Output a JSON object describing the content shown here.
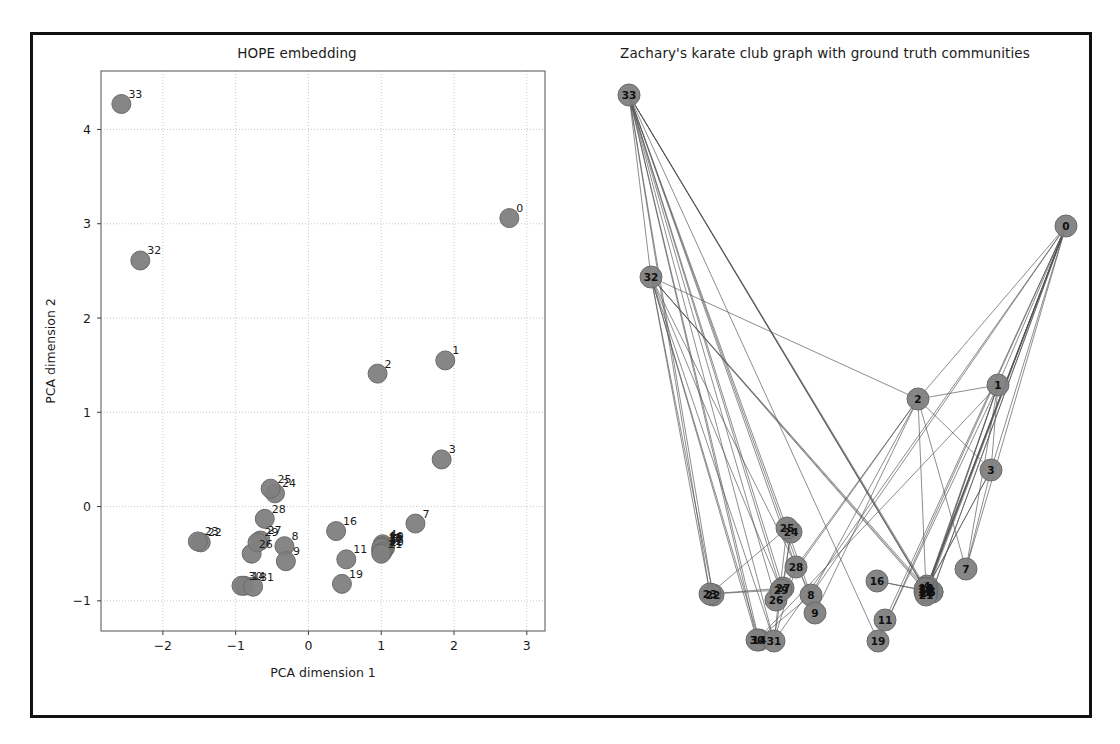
{
  "figure": {
    "background": "#ffffff",
    "frame_color": "#111111",
    "node_color": "#808080",
    "node_edge_color": "#6b6b6b",
    "edge_color": "#555555",
    "grid_color": "#c8c8c8"
  },
  "panels": [
    {
      "id": "hope-embedding",
      "title": "HOPE embedding",
      "xlabel": "PCA dimension 1",
      "ylabel": "PCA dimension 2",
      "xticks": [
        -2,
        -1,
        0,
        1,
        2,
        3
      ],
      "yticks": [
        -1,
        0,
        1,
        2,
        3,
        4
      ],
      "xlim": [
        -2.85,
        3.25
      ],
      "ylim": [
        -1.32,
        4.62
      ]
    },
    {
      "id": "karate-graph",
      "title": "Zachary's karate club graph with ground truth communities"
    }
  ],
  "chart_data": {
    "type": "scatter",
    "title": "HOPE embedding",
    "xlabel": "PCA dimension 1",
    "ylabel": "PCA dimension 2",
    "xlim": [
      -2.85,
      3.25
    ],
    "ylim": [
      -1.32,
      4.62
    ],
    "xticks": [
      -2,
      -1,
      0,
      1,
      2,
      3
    ],
    "yticks": [
      -1,
      0,
      1,
      2,
      3,
      4
    ],
    "grid": true,
    "legend": null,
    "point_labels_shown": true,
    "series": [
      {
        "name": "karate club nodes (HOPE + PCA)",
        "points": [
          {
            "label": "0",
            "x": 2.76,
            "y": 3.06
          },
          {
            "label": "1",
            "x": 1.88,
            "y": 1.55
          },
          {
            "label": "2",
            "x": 0.95,
            "y": 1.41
          },
          {
            "label": "3",
            "x": 1.83,
            "y": 0.5
          },
          {
            "label": "4",
            "x": 1.02,
            "y": -0.4
          },
          {
            "label": "5",
            "x": 1.05,
            "y": -0.44
          },
          {
            "label": "6",
            "x": 1.05,
            "y": -0.44
          },
          {
            "label": "7",
            "x": 1.47,
            "y": -0.18
          },
          {
            "label": "8",
            "x": -0.33,
            "y": -0.42
          },
          {
            "label": "9",
            "x": -0.31,
            "y": -0.58
          },
          {
            "label": "10",
            "x": 1.02,
            "y": -0.42
          },
          {
            "label": "11",
            "x": 0.52,
            "y": -0.56
          },
          {
            "label": "12",
            "x": 1.0,
            "y": -0.47
          },
          {
            "label": "13",
            "x": 1.02,
            "y": -0.45
          },
          {
            "label": "14",
            "x": -0.88,
            "y": -0.84
          },
          {
            "label": "15",
            "x": 1.01,
            "y": -0.43
          },
          {
            "label": "16",
            "x": 0.38,
            "y": -0.26
          },
          {
            "label": "17",
            "x": 1.01,
            "y": -0.46
          },
          {
            "label": "18",
            "x": 1.0,
            "y": -0.44
          },
          {
            "label": "19",
            "x": 0.46,
            "y": -0.82
          },
          {
            "label": "20",
            "x": 1.02,
            "y": -0.48
          },
          {
            "label": "21",
            "x": 1.0,
            "y": -0.5
          },
          {
            "label": "22",
            "x": -1.48,
            "y": -0.38
          },
          {
            "label": "23",
            "x": -1.52,
            "y": -0.37
          },
          {
            "label": "24",
            "x": -0.46,
            "y": 0.14
          },
          {
            "label": "25",
            "x": -0.52,
            "y": 0.19
          },
          {
            "label": "26",
            "x": -0.78,
            "y": -0.5
          },
          {
            "label": "27",
            "x": -0.66,
            "y": -0.36
          },
          {
            "label": "28",
            "x": -0.6,
            "y": -0.13
          },
          {
            "label": "29",
            "x": -0.7,
            "y": -0.38
          },
          {
            "label": "30",
            "x": -0.92,
            "y": -0.84
          },
          {
            "label": "31",
            "x": -0.76,
            "y": -0.85
          },
          {
            "label": "32",
            "x": -2.31,
            "y": 2.61
          },
          {
            "label": "33",
            "x": -2.57,
            "y": 4.27
          }
        ]
      }
    ]
  },
  "graph": {
    "title": "Zachary's karate club graph with ground truth communities",
    "node_labels_inside": true,
    "nodes": [
      {
        "id": "0",
        "x": 1065,
        "y": 223
      },
      {
        "id": "1",
        "x": 997,
        "y": 382
      },
      {
        "id": "2",
        "x": 917,
        "y": 396
      },
      {
        "id": "3",
        "x": 990,
        "y": 467
      },
      {
        "id": "4",
        "x": 926,
        "y": 583
      },
      {
        "id": "5",
        "x": 931,
        "y": 589
      },
      {
        "id": "6",
        "x": 931,
        "y": 589
      },
      {
        "id": "7",
        "x": 965,
        "y": 566
      },
      {
        "id": "8",
        "x": 810,
        "y": 592
      },
      {
        "id": "9",
        "x": 814,
        "y": 610
      },
      {
        "id": "10",
        "x": 926,
        "y": 586
      },
      {
        "id": "11",
        "x": 884,
        "y": 617
      },
      {
        "id": "12",
        "x": 924,
        "y": 589
      },
      {
        "id": "13",
        "x": 925,
        "y": 587
      },
      {
        "id": "14",
        "x": 758,
        "y": 637
      },
      {
        "id": "15",
        "x": 925,
        "y": 585
      },
      {
        "id": "16",
        "x": 876,
        "y": 578
      },
      {
        "id": "17",
        "x": 925,
        "y": 589
      },
      {
        "id": "18",
        "x": 924,
        "y": 586
      },
      {
        "id": "19",
        "x": 877,
        "y": 638
      },
      {
        "id": "20",
        "x": 926,
        "y": 590
      },
      {
        "id": "21",
        "x": 925,
        "y": 592
      },
      {
        "id": "22",
        "x": 712,
        "y": 592
      },
      {
        "id": "23",
        "x": 709,
        "y": 591
      },
      {
        "id": "24",
        "x": 790,
        "y": 529
      },
      {
        "id": "25",
        "x": 786,
        "y": 525
      },
      {
        "id": "26",
        "x": 775,
        "y": 597
      },
      {
        "id": "27",
        "x": 782,
        "y": 585
      },
      {
        "id": "28",
        "x": 795,
        "y": 564
      },
      {
        "id": "29",
        "x": 780,
        "y": 587
      },
      {
        "id": "30",
        "x": 756,
        "y": 637
      },
      {
        "id": "31",
        "x": 773,
        "y": 638
      },
      {
        "id": "32",
        "x": 650,
        "y": 274
      },
      {
        "id": "33",
        "x": 628,
        "y": 92
      }
    ],
    "edges": [
      [
        "0",
        "1"
      ],
      [
        "0",
        "2"
      ],
      [
        "0",
        "3"
      ],
      [
        "0",
        "4"
      ],
      [
        "0",
        "5"
      ],
      [
        "0",
        "6"
      ],
      [
        "0",
        "7"
      ],
      [
        "0",
        "8"
      ],
      [
        "0",
        "10"
      ],
      [
        "0",
        "11"
      ],
      [
        "0",
        "12"
      ],
      [
        "0",
        "13"
      ],
      [
        "0",
        "17"
      ],
      [
        "0",
        "19"
      ],
      [
        "0",
        "21"
      ],
      [
        "0",
        "31"
      ],
      [
        "1",
        "2"
      ],
      [
        "1",
        "3"
      ],
      [
        "1",
        "7"
      ],
      [
        "1",
        "13"
      ],
      [
        "1",
        "17"
      ],
      [
        "1",
        "19"
      ],
      [
        "1",
        "21"
      ],
      [
        "1",
        "30"
      ],
      [
        "2",
        "3"
      ],
      [
        "2",
        "7"
      ],
      [
        "2",
        "8"
      ],
      [
        "2",
        "9"
      ],
      [
        "2",
        "13"
      ],
      [
        "2",
        "27"
      ],
      [
        "2",
        "28"
      ],
      [
        "2",
        "32"
      ],
      [
        "3",
        "7"
      ],
      [
        "3",
        "12"
      ],
      [
        "3",
        "13"
      ],
      [
        "4",
        "6"
      ],
      [
        "4",
        "10"
      ],
      [
        "5",
        "6"
      ],
      [
        "5",
        "10"
      ],
      [
        "5",
        "16"
      ],
      [
        "6",
        "16"
      ],
      [
        "8",
        "30"
      ],
      [
        "8",
        "32"
      ],
      [
        "8",
        "33"
      ],
      [
        "9",
        "33"
      ],
      [
        "13",
        "33"
      ],
      [
        "14",
        "32"
      ],
      [
        "14",
        "33"
      ],
      [
        "15",
        "32"
      ],
      [
        "15",
        "33"
      ],
      [
        "18",
        "32"
      ],
      [
        "18",
        "33"
      ],
      [
        "19",
        "33"
      ],
      [
        "20",
        "32"
      ],
      [
        "20",
        "33"
      ],
      [
        "22",
        "32"
      ],
      [
        "22",
        "33"
      ],
      [
        "23",
        "25"
      ],
      [
        "23",
        "27"
      ],
      [
        "23",
        "29"
      ],
      [
        "23",
        "32"
      ],
      [
        "23",
        "33"
      ],
      [
        "24",
        "25"
      ],
      [
        "24",
        "27"
      ],
      [
        "24",
        "31"
      ],
      [
        "25",
        "31"
      ],
      [
        "26",
        "29"
      ],
      [
        "26",
        "33"
      ],
      [
        "27",
        "33"
      ],
      [
        "28",
        "31"
      ],
      [
        "28",
        "33"
      ],
      [
        "29",
        "32"
      ],
      [
        "29",
        "33"
      ],
      [
        "30",
        "32"
      ],
      [
        "30",
        "33"
      ],
      [
        "31",
        "32"
      ],
      [
        "31",
        "33"
      ],
      [
        "32",
        "33"
      ]
    ]
  }
}
